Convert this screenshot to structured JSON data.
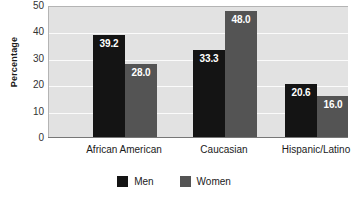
{
  "chart_data": {
    "type": "bar",
    "title": "",
    "xlabel": "",
    "ylabel": "Percentage",
    "ylim": [
      0,
      50
    ],
    "yticks": [
      50,
      40,
      30,
      20,
      10,
      0
    ],
    "grid": true,
    "legend_position": "bottom-center",
    "categories": [
      "African American",
      "Caucasian",
      "Hispanic/Latino"
    ],
    "series": [
      {
        "name": "Men",
        "color": "#141414",
        "values": [
          39.2,
          33.3,
          20.6
        ],
        "labels": [
          "39.2",
          "33.3",
          "20.6"
        ]
      },
      {
        "name": "Women",
        "color": "#545454",
        "values": [
          28.0,
          48.0,
          16.0
        ],
        "labels": [
          "28.0",
          "48.0",
          "16.0"
        ]
      }
    ]
  },
  "axes": {
    "y_title": "Percentage",
    "y_tick_labels": [
      "50",
      "40",
      "30",
      "20",
      "10",
      "0"
    ]
  },
  "legend": {
    "items": [
      {
        "label": "Men",
        "color": "#141414"
      },
      {
        "label": "Women",
        "color": "#545454"
      }
    ]
  },
  "colors": {
    "plot_background": "#e2e2e2",
    "gridline": "#fbfbfb",
    "axis": "#777777",
    "men": "#141414",
    "women": "#545454",
    "value_label": "#ffffff",
    "text": "#1a1a1a"
  }
}
